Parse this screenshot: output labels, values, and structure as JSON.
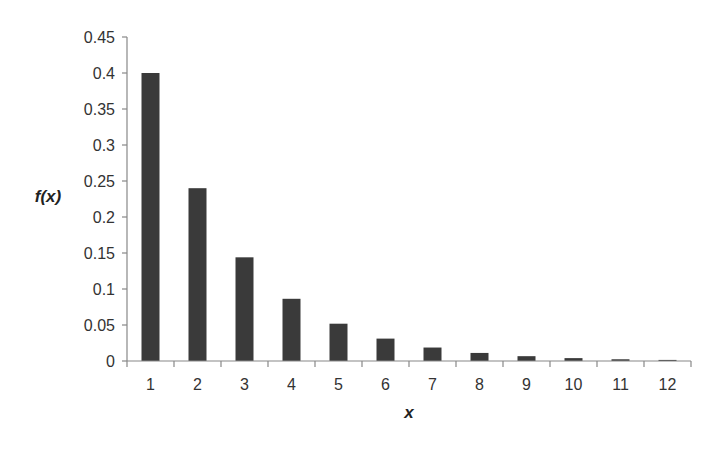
{
  "chart_data": {
    "type": "bar",
    "title": "",
    "xlabel": "x",
    "ylabel": "f(x)",
    "categories": [
      "1",
      "2",
      "3",
      "4",
      "5",
      "6",
      "7",
      "8",
      "9",
      "10",
      "11",
      "12"
    ],
    "values": [
      0.4,
      0.24,
      0.144,
      0.0864,
      0.0518,
      0.0311,
      0.0187,
      0.0112,
      0.0067,
      0.004,
      0.0024,
      0.0015
    ],
    "ylim": [
      0,
      0.45
    ],
    "yticks": [
      "0",
      "0.05",
      "0.1",
      "0.15",
      "0.2",
      "0.25",
      "0.3",
      "0.35",
      "0.4",
      "0.45"
    ],
    "grid": false,
    "legend": null,
    "bar_color": "#3a3a3a",
    "axis_color": "#888888"
  }
}
